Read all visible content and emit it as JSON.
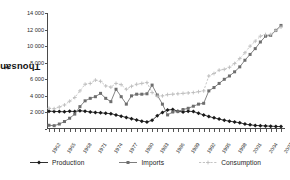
{
  "chart_data": {
    "type": "line",
    "title": "",
    "subtitle": "",
    "xlabel": "",
    "ylabel": "Thousands m",
    "ylabel_sup": "3",
    "ylim": [
      0,
      14000
    ],
    "ytick_labels": [
      "14 000",
      "12 000",
      "10 000",
      "8 000",
      "6 000",
      "4 000",
      "2 000",
      "0"
    ],
    "ytick_values": [
      14000,
      12000,
      10000,
      8000,
      6000,
      4000,
      2000,
      0
    ],
    "grid": false,
    "legend_position": "bottom",
    "x": [
      1962,
      1963,
      1964,
      1965,
      1966,
      1967,
      1968,
      1969,
      1970,
      1971,
      1972,
      1973,
      1974,
      1975,
      1976,
      1977,
      1978,
      1979,
      1980,
      1981,
      1982,
      1983,
      1984,
      1985,
      1986,
      1987,
      1988,
      1989,
      1990,
      1991,
      1992,
      1993,
      1994,
      1995,
      1996,
      1997,
      1998,
      1999,
      2000,
      2001,
      2002,
      2003,
      2004,
      2005,
      2006,
      2007
    ],
    "xtick_labels": [
      "1962",
      "1965",
      "1968",
      "1971",
      "1974",
      "1977",
      "1980",
      "1983",
      "1986",
      "1989",
      "1992",
      "1995",
      "1998",
      "2001",
      "2004",
      "2007"
    ],
    "xtick_every": 3,
    "series": [
      {
        "name": "Production",
        "color": "#1a1a1a",
        "marker": "diamond",
        "dash": "solid",
        "values": [
          2150,
          2120,
          2100,
          2080,
          2150,
          2100,
          2200,
          2150,
          2050,
          2000,
          1950,
          1900,
          1850,
          1700,
          1550,
          1400,
          1250,
          1100,
          950,
          850,
          1050,
          1600,
          2000,
          2300,
          2350,
          2150,
          2050,
          2150,
          2100,
          1900,
          1700,
          1500,
          1350,
          1200,
          1050,
          950,
          850,
          750,
          600,
          500,
          430,
          400,
          370,
          340,
          310,
          290
        ]
      },
      {
        "name": "Imports",
        "color": "#6e6e6e",
        "marker": "square",
        "dash": "solid",
        "values": [
          450,
          400,
          600,
          900,
          1300,
          1800,
          2700,
          3400,
          3700,
          3900,
          4300,
          3700,
          3300,
          4800,
          3900,
          3000,
          4000,
          4200,
          4200,
          4250,
          5300,
          4100,
          3000,
          1700,
          2050,
          2100,
          2350,
          2500,
          2750,
          3000,
          3100,
          4600,
          5000,
          5500,
          6000,
          6400,
          6900,
          7500,
          8300,
          9000,
          9700,
          10500,
          11200,
          11300,
          11900,
          12500
        ]
      },
      {
        "name": "Consumption",
        "color": "#bdbdbd",
        "marker": "plus",
        "dash": "dashed",
        "values": [
          2500,
          2450,
          2650,
          2900,
          3350,
          3800,
          4600,
          5400,
          5500,
          5900,
          5750,
          5200,
          5050,
          5500,
          5350,
          4800,
          5150,
          5400,
          5500,
          5600,
          4400,
          3950,
          4000,
          4150,
          4200,
          4250,
          4300,
          4350,
          4400,
          4500,
          4600,
          6400,
          6700,
          7100,
          7200,
          7450,
          7900,
          8500,
          9200,
          10000,
          10600,
          11200,
          11400,
          11400,
          11900,
          12300
        ]
      }
    ]
  },
  "legend": {
    "items": [
      {
        "label": "Production"
      },
      {
        "label": "Imports"
      },
      {
        "label": "Consumption"
      }
    ]
  }
}
